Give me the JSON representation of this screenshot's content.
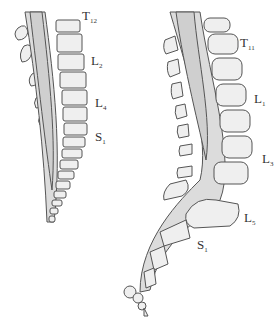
{
  "figure": {
    "left_panel": {
      "description": "Early-stage spinal cord extending along entire vertebral column",
      "labels": [
        {
          "letter": "T",
          "sub": "12"
        },
        {
          "letter": "L",
          "sub": "2"
        },
        {
          "letter": "L",
          "sub": "4"
        },
        {
          "letter": "S",
          "sub": "1"
        }
      ]
    },
    "right_panel": {
      "description": "Later-stage spinal cord ending higher relative to vertebral column",
      "labels": [
        {
          "letter": "T",
          "sub": "11"
        },
        {
          "letter": "L",
          "sub": "1"
        },
        {
          "letter": "L",
          "sub": "3"
        },
        {
          "letter": "L",
          "sub": "5"
        },
        {
          "letter": "S",
          "sub": "1"
        }
      ]
    }
  },
  "colors": {
    "outline": "#555555",
    "vertebra_fill": "#efefef",
    "cord_fill": "#cfcfcf",
    "canal_fill": "#dcdcdc",
    "label": "#333333"
  }
}
